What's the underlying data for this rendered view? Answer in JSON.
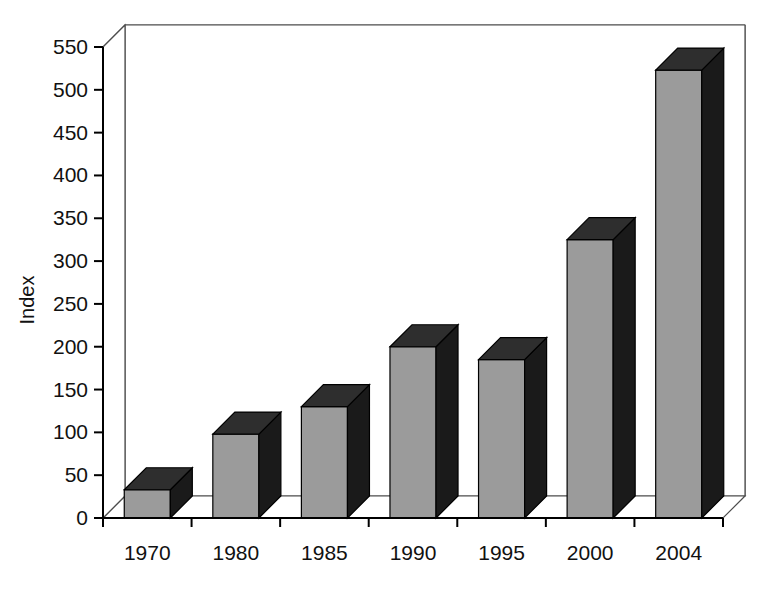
{
  "chart_data": {
    "type": "bar",
    "title": "",
    "subtitle": "",
    "xlabel": "",
    "ylabel": "Index",
    "categories": [
      "1970",
      "1980",
      "1985",
      "1990",
      "1995",
      "2000",
      "2004"
    ],
    "values": [
      33,
      98,
      130,
      200,
      185,
      325,
      523
    ],
    "series": [
      {
        "name": "Index",
        "values": [
          33,
          98,
          130,
          200,
          185,
          325,
          523
        ]
      }
    ],
    "ylim": [
      0,
      550
    ],
    "ytick_step": 50,
    "ytick_labels": [
      "0",
      "50",
      "100",
      "150",
      "200",
      "250",
      "300",
      "350",
      "400",
      "450",
      "500",
      "550"
    ],
    "ytick_values": [
      0,
      50,
      100,
      150,
      200,
      250,
      300,
      350,
      400,
      450,
      500,
      550
    ],
    "grid": true,
    "grid_axis": "y",
    "legend": false,
    "legend_position": "none",
    "style": "3d-column",
    "bar_face_color": "#9b9b9b",
    "bar_side_color": "#1a1a1a",
    "bar_top_color": "#2e2e2e",
    "axis_color": "#000000",
    "grid_color": "#4d4d4d",
    "background_color": "#ffffff",
    "annotations": []
  }
}
